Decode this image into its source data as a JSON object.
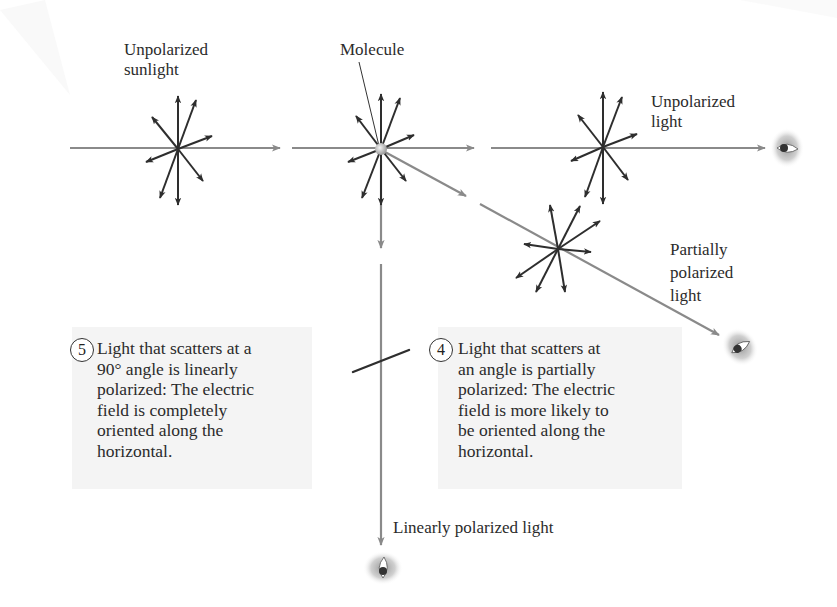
{
  "diagram": {
    "colors": {
      "beam": "#8a8a8a",
      "field_vector": "#2e2e2e",
      "callout_bg": "#f4f4f4",
      "text": "#2b2b2b"
    },
    "labels": {
      "unpolarized_sunlight": [
        "Unpolarized",
        "sunlight"
      ],
      "molecule": "Molecule",
      "unpolarized_light": [
        "Unpolarized",
        "light"
      ],
      "partially_polarized_light": [
        "Partially",
        "polarized",
        "light"
      ],
      "linearly_polarized_light": "Linearly polarized light"
    },
    "callouts": [
      {
        "number": "5",
        "lines": [
          "Light that scatters at a",
          "90° angle is linearly",
          "polarized: The electric",
          "field is completely",
          "oriented along the",
          "horizontal."
        ]
      },
      {
        "number": "4",
        "lines": [
          "Light that scatters at",
          "an angle is partially",
          "polarized: The electric",
          "field is more likely to",
          "be oriented along the",
          "horizontal."
        ]
      }
    ],
    "icons": [
      "eye-icon-right",
      "eye-icon-diagonal",
      "eye-icon-bottom",
      "molecule-icon"
    ]
  }
}
